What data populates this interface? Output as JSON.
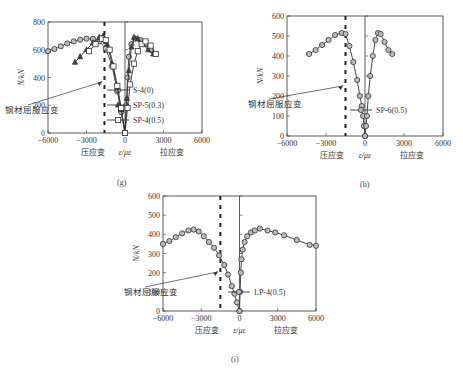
{
  "chart_data": [
    {
      "id": "g",
      "panel_label": "(g)",
      "type": "line",
      "xlabel": "ε/με",
      "xlabel_left": "压应变",
      "xlabel_right": "拉应变",
      "ylabel": "N/kN",
      "xlim": [
        -6000,
        6000
      ],
      "ylim": [
        0,
        800
      ],
      "xticks": [
        -6000,
        -3000,
        0,
        3000,
        6000
      ],
      "yticks": [
        0,
        200,
        400,
        600,
        800
      ],
      "annotation": {
        "text": "钢材屈服应变",
        "x": -1600
      },
      "legend_position": "right-center",
      "series": [
        {
          "name": "S-4(0)",
          "marker": "circle",
          "left": [
            [
              -6000,
              590
            ],
            [
              -5500,
              605
            ],
            [
              -5000,
              625
            ],
            [
              -4500,
              645
            ],
            [
              -4000,
              660
            ],
            [
              -3500,
              672
            ],
            [
              -3000,
              680
            ],
            [
              -2500,
              678
            ],
            [
              -2000,
              660
            ],
            [
              -1500,
              610
            ],
            [
              -1000,
              480
            ],
            [
              -600,
              300
            ],
            [
              -300,
              150
            ],
            [
              0,
              0
            ]
          ],
          "right": [
            [
              0,
              0
            ],
            [
              100,
              200
            ],
            [
              200,
              400
            ],
            [
              300,
              550
            ],
            [
              500,
              640
            ],
            [
              800,
              680
            ],
            [
              1200,
              670
            ],
            [
              1600,
              640
            ],
            [
              2000,
              600
            ],
            [
              2300,
              570
            ]
          ]
        },
        {
          "name": "SP-5(0.3)",
          "marker": "triangle",
          "left": [
            [
              -3900,
              510
            ],
            [
              -3500,
              550
            ],
            [
              -3000,
              600
            ],
            [
              -2500,
              650
            ],
            [
              -2000,
              690
            ],
            [
              -1700,
              700
            ],
            [
              -1400,
              640
            ],
            [
              -1000,
              500
            ],
            [
              -600,
              330
            ],
            [
              -300,
              170
            ],
            [
              0,
              0
            ]
          ],
          "right": [
            [
              0,
              0
            ],
            [
              150,
              250
            ],
            [
              300,
              450
            ],
            [
              500,
              620
            ],
            [
              700,
              690
            ],
            [
              1000,
              680
            ],
            [
              1400,
              640
            ],
            [
              1800,
              600
            ],
            [
              2200,
              570
            ]
          ]
        },
        {
          "name": "SP-4(0.5)",
          "marker": "square",
          "left": [
            [
              -2800,
              590
            ],
            [
              -2300,
              640
            ],
            [
              -1800,
              680
            ],
            [
              -1500,
              670
            ],
            [
              -1200,
              600
            ],
            [
              -900,
              480
            ],
            [
              -600,
              340
            ],
            [
              -300,
              180
            ],
            [
              0,
              0
            ]
          ],
          "right": [
            [
              0,
              0
            ],
            [
              200,
              180
            ],
            [
              400,
              350
            ],
            [
              700,
              500
            ],
            [
              1000,
              590
            ],
            [
              1300,
              640
            ],
            [
              1600,
              660
            ],
            [
              2000,
              630
            ],
            [
              2400,
              570
            ]
          ]
        }
      ]
    },
    {
      "id": "h",
      "panel_label": "(h)",
      "type": "line",
      "xlabel": "ε/με",
      "xlabel_left": "压应变",
      "xlabel_right": "拉应变",
      "ylabel": "N/kN",
      "xlim": [
        -6000,
        6000
      ],
      "ylim": [
        0,
        600
      ],
      "xticks": [
        -6000,
        -3000,
        0,
        3000,
        6000
      ],
      "yticks": [
        0,
        100,
        200,
        300,
        400,
        500,
        600
      ],
      "annotation": {
        "text": "钢材屈服应变",
        "x": -1500
      },
      "legend_position": "right-lower",
      "series": [
        {
          "name": "SP-6(0.5)",
          "marker": "circle",
          "left": [
            [
              -4300,
              410
            ],
            [
              -3800,
              430
            ],
            [
              -3300,
              455
            ],
            [
              -2800,
              480
            ],
            [
              -2300,
              505
            ],
            [
              -1800,
              515
            ],
            [
              -1500,
              510
            ],
            [
              -1200,
              450
            ],
            [
              -900,
              370
            ],
            [
              -600,
              280
            ],
            [
              -400,
              200
            ],
            [
              -250,
              150
            ],
            [
              -150,
              100
            ],
            [
              -80,
              50
            ],
            [
              0,
              0
            ]
          ],
          "right": [
            [
              0,
              0
            ],
            [
              80,
              50
            ],
            [
              150,
              100
            ],
            [
              250,
              200
            ],
            [
              400,
              300
            ],
            [
              600,
              400
            ],
            [
              800,
              480
            ],
            [
              1000,
              515
            ],
            [
              1200,
              510
            ],
            [
              1500,
              470
            ],
            [
              1800,
              430
            ],
            [
              2100,
              410
            ]
          ]
        }
      ]
    },
    {
      "id": "i",
      "panel_label": "(i)",
      "type": "line",
      "xlabel": "ε/με",
      "xlabel_left": "压应变",
      "xlabel_right": "拉应变",
      "ylabel": "N/kN",
      "xlim": [
        -6000,
        6000
      ],
      "ylim": [
        0,
        600
      ],
      "xticks": [
        -6000,
        -3000,
        0,
        3000,
        6000
      ],
      "yticks": [
        0,
        100,
        200,
        300,
        400,
        500,
        600
      ],
      "annotation": {
        "text": "钢材屈服应变",
        "x": -1500
      },
      "legend_position": "right-lower",
      "series": [
        {
          "name": "LP-4(0.5)",
          "marker": "circle",
          "left": [
            [
              -6000,
              350
            ],
            [
              -5500,
              365
            ],
            [
              -5000,
              385
            ],
            [
              -4500,
              405
            ],
            [
              -4000,
              420
            ],
            [
              -3600,
              425
            ],
            [
              -3200,
              415
            ],
            [
              -2800,
              390
            ],
            [
              -2400,
              360
            ],
            [
              -2000,
              330
            ],
            [
              -1600,
              290
            ],
            [
              -1200,
              240
            ],
            [
              -900,
              190
            ],
            [
              -600,
              130
            ],
            [
              -400,
              90
            ],
            [
              -200,
              45
            ],
            [
              0,
              0
            ]
          ],
          "right": [
            [
              0,
              0
            ],
            [
              50,
              100
            ],
            [
              100,
              200
            ],
            [
              150,
              270
            ],
            [
              250,
              320
            ],
            [
              400,
              360
            ],
            [
              600,
              390
            ],
            [
              900,
              410
            ],
            [
              1200,
              420
            ],
            [
              1600,
              430
            ],
            [
              2200,
              420
            ],
            [
              2800,
              410
            ],
            [
              3500,
              395
            ],
            [
              4500,
              370
            ],
            [
              5500,
              345
            ],
            [
              6000,
              340
            ]
          ]
        }
      ]
    }
  ]
}
